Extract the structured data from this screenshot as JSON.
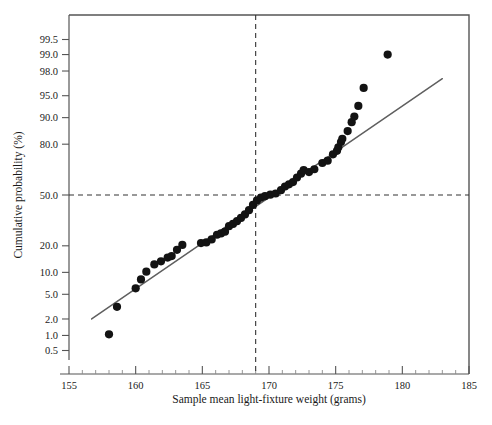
{
  "figure": {
    "width": 492,
    "height": 425,
    "background": "#ffffff"
  },
  "axes": {
    "x_title": "Sample mean light-fixture weight (grams)",
    "y_title": "Cumulative probability (%)"
  },
  "chart_data": {
    "type": "scatter",
    "title": "",
    "subtitle": "",
    "xlabel": "Sample mean light-fixture weight (grams)",
    "ylabel": "Cumulative probability (%)",
    "plot_kind": "normal-probability-plot",
    "xlim": [
      155,
      185
    ],
    "ylim_percent": [
      0.35,
      99.8
    ],
    "y_scale": "normal-probability",
    "grid": false,
    "legend": null,
    "xticks": [
      155,
      160,
      165,
      170,
      175,
      180,
      185
    ],
    "xtick_labels": [
      "155",
      "160",
      "165",
      "170",
      "175",
      "180",
      "185"
    ],
    "x_minor_ticks": [
      156,
      157,
      158,
      159,
      161,
      162,
      163,
      164,
      166,
      167,
      168,
      169,
      171,
      172,
      173,
      174,
      176,
      177,
      178,
      179,
      181,
      182,
      183,
      184
    ],
    "yticks": [
      0.5,
      1.0,
      2.0,
      5.0,
      10.0,
      20.0,
      50.0,
      80.0,
      90.0,
      95.0,
      98.0,
      99.0,
      99.5
    ],
    "ytick_labels": [
      "0.5",
      "1.0",
      "2.0",
      "5.0",
      "10.0",
      "20.0",
      "50.0",
      "80.0",
      "90.0",
      "95.0",
      "98.0",
      "99.0",
      "99.5"
    ],
    "reference_lines": [
      {
        "name": "median-horizontal",
        "orientation": "horizontal",
        "value_percent": 50.0,
        "style": "dashed"
      },
      {
        "name": "median-vertical",
        "orientation": "vertical",
        "value_x": 169.0,
        "style": "dashed"
      }
    ],
    "fit_line": {
      "name": "normal-fit-line",
      "x_start": 156.7,
      "y_start_percent": 2.0,
      "x_end": 183.0,
      "y_end_percent": 97.3,
      "style": "solid",
      "color": "#5f5f5f"
    },
    "series": [
      {
        "name": "Sample means",
        "marker": "filled-circle",
        "color": "#131313",
        "points": [
          {
            "x": 158.0,
            "p": 1.05
          },
          {
            "x": 158.6,
            "p": 3.2
          },
          {
            "x": 160.0,
            "p": 6.1
          },
          {
            "x": 160.4,
            "p": 8.1
          },
          {
            "x": 160.8,
            "p": 10.2
          },
          {
            "x": 161.4,
            "p": 12.5
          },
          {
            "x": 161.9,
            "p": 13.6
          },
          {
            "x": 162.4,
            "p": 15.0
          },
          {
            "x": 162.7,
            "p": 15.6
          },
          {
            "x": 163.1,
            "p": 18.2
          },
          {
            "x": 163.5,
            "p": 20.4
          },
          {
            "x": 164.9,
            "p": 21.3
          },
          {
            "x": 165.3,
            "p": 21.6
          },
          {
            "x": 165.7,
            "p": 23.1
          },
          {
            "x": 166.1,
            "p": 25.5
          },
          {
            "x": 166.4,
            "p": 26.2
          },
          {
            "x": 166.7,
            "p": 27.2
          },
          {
            "x": 167.0,
            "p": 30.3
          },
          {
            "x": 167.3,
            "p": 31.6
          },
          {
            "x": 167.6,
            "p": 33.2
          },
          {
            "x": 167.9,
            "p": 35.2
          },
          {
            "x": 168.2,
            "p": 37.4
          },
          {
            "x": 168.5,
            "p": 40.1
          },
          {
            "x": 168.8,
            "p": 43.5
          },
          {
            "x": 169.1,
            "p": 46.4
          },
          {
            "x": 169.4,
            "p": 48.3
          },
          {
            "x": 169.7,
            "p": 49.2
          },
          {
            "x": 170.1,
            "p": 50.2
          },
          {
            "x": 170.5,
            "p": 51.0
          },
          {
            "x": 170.9,
            "p": 53.2
          },
          {
            "x": 171.2,
            "p": 55.6
          },
          {
            "x": 171.5,
            "p": 57.0
          },
          {
            "x": 171.8,
            "p": 58.5
          },
          {
            "x": 172.1,
            "p": 61.4
          },
          {
            "x": 172.4,
            "p": 63.8
          },
          {
            "x": 172.6,
            "p": 66.0
          },
          {
            "x": 173.0,
            "p": 64.8
          },
          {
            "x": 173.4,
            "p": 66.5
          },
          {
            "x": 174.0,
            "p": 70.2
          },
          {
            "x": 174.4,
            "p": 71.5
          },
          {
            "x": 174.8,
            "p": 75.0
          },
          {
            "x": 175.1,
            "p": 76.8
          },
          {
            "x": 175.2,
            "p": 78.5
          },
          {
            "x": 175.4,
            "p": 81.0
          },
          {
            "x": 175.5,
            "p": 82.4
          },
          {
            "x": 175.9,
            "p": 85.5
          },
          {
            "x": 176.2,
            "p": 88.6
          },
          {
            "x": 176.4,
            "p": 90.3
          },
          {
            "x": 176.7,
            "p": 93.0
          },
          {
            "x": 177.1,
            "p": 96.2
          },
          {
            "x": 178.9,
            "p": 99.0
          }
        ]
      }
    ]
  }
}
